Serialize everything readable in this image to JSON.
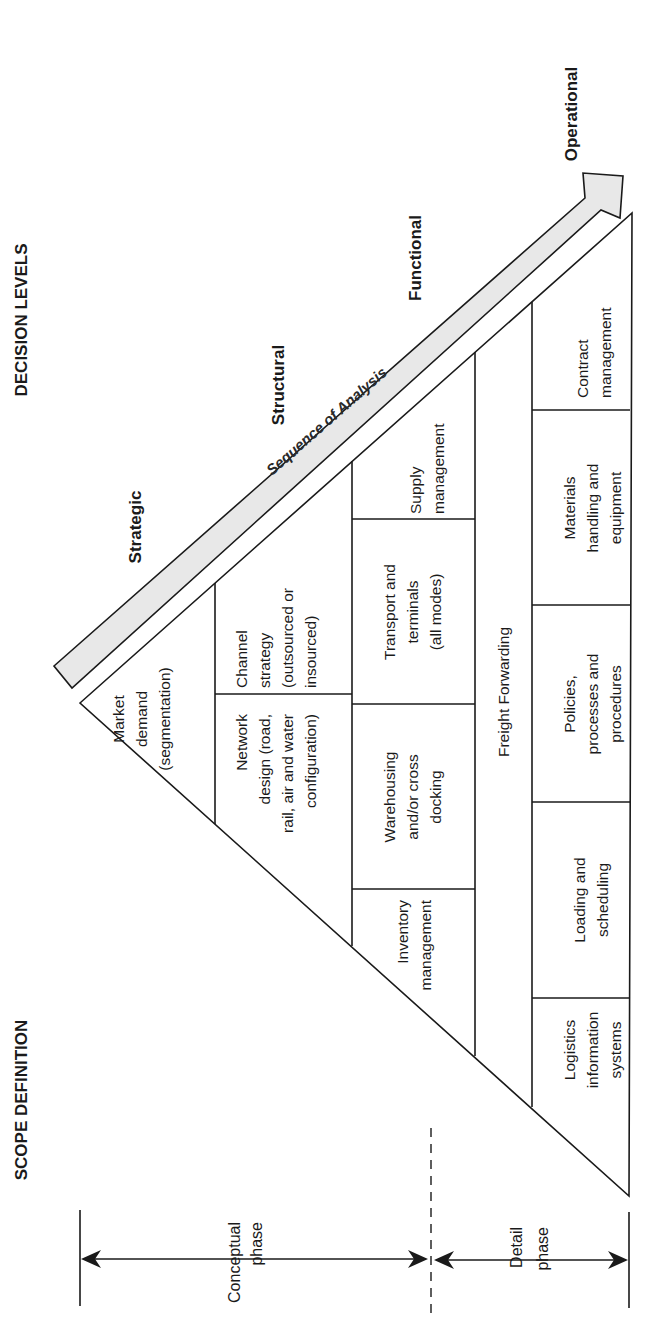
{
  "headers": {
    "decision_levels": "DECISION LEVELS",
    "scope_definition": "SCOPE DEFINITION"
  },
  "decision_levels": {
    "strategic": "Strategic",
    "structural": "Structural",
    "functional": "Functional",
    "operational": "Operational"
  },
  "sequence_arrow": {
    "label": "Sequence of Analysis",
    "fill_color": "#e6e6e6"
  },
  "phases": {
    "conceptual": [
      "Conceptual",
      "phase"
    ],
    "detail": [
      "Detail",
      "phase"
    ]
  },
  "pyramid": {
    "row1": {
      "market_demand": [
        "Market",
        "demand",
        "(segmentation)"
      ]
    },
    "row2": {
      "network_design": [
        "Network",
        "design (road,",
        "rail, air and water",
        "configuration)"
      ],
      "channel_strategy": [
        "Channel",
        "strategy",
        "(outsourced or",
        "insourced)"
      ]
    },
    "row3": {
      "inventory_management": [
        "Inventory",
        "management"
      ],
      "warehousing": [
        "Warehousing",
        "and/or cross",
        "docking"
      ],
      "transport_terminals": [
        "Transport and",
        "terminals",
        "(all modes)"
      ],
      "supply_management": [
        "Supply",
        "management"
      ]
    },
    "row4": {
      "freight_forwarding": [
        "Freight Forwarding"
      ]
    },
    "row5": {
      "logistics_information_systems": [
        "Logistics",
        "information",
        "systems"
      ],
      "loading_scheduling": [
        "Loading and",
        "scheduling"
      ],
      "policies": [
        "Policies,",
        "processes and",
        "procedures"
      ],
      "materials_handling": [
        "Materials",
        "handling and",
        "equipment"
      ],
      "contract_management": [
        "Contract",
        "management"
      ]
    }
  }
}
